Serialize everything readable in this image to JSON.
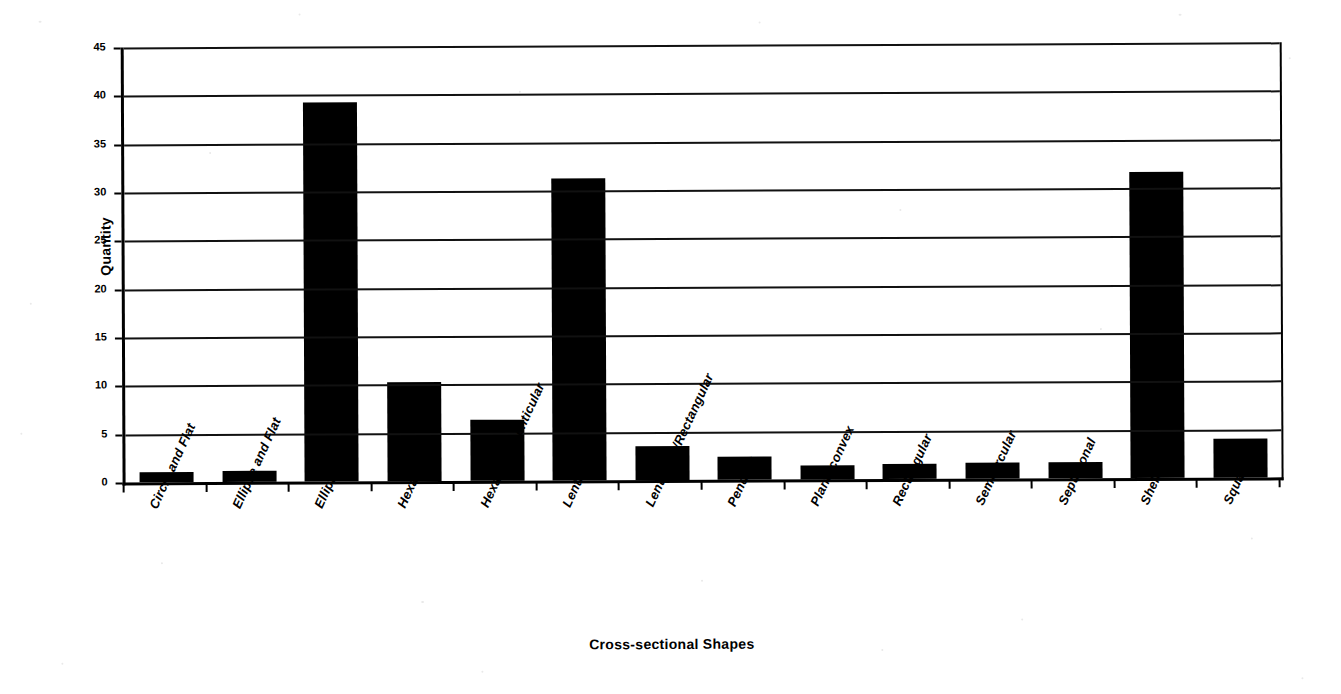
{
  "chart_data": {
    "type": "bar",
    "title": "",
    "xlabel": "Cross-sectional Shapes",
    "ylabel": "Quantity",
    "ylim": [
      0,
      45
    ],
    "ytick_step": 5,
    "yticks": [
      0,
      5,
      10,
      15,
      20,
      25,
      30,
      35,
      40,
      45
    ],
    "grid": true,
    "legend": false,
    "bar_color": "#000000",
    "categories": [
      "Circle and Flat",
      "Ellipse and Flat",
      "Elliptical",
      "Hexagonal",
      "Hexagonal Lenticular",
      "Lenticular",
      "Lenticular/Rectangular",
      "Pendant",
      "Plano-convex",
      "Rectangular",
      "Semicircular",
      "Septagonal",
      "Shell",
      "Square"
    ],
    "values": [
      1,
      1.1,
      39.2,
      10.2,
      6.3,
      31.2,
      3.5,
      2.4,
      1.5,
      1.6,
      1.7,
      1.7,
      31.7,
      4
    ]
  }
}
